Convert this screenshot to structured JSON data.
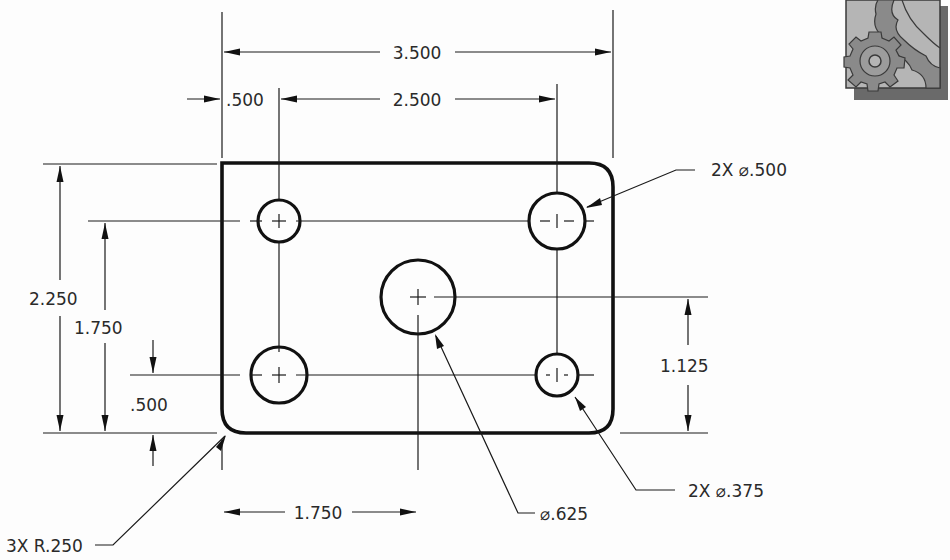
{
  "drawing": {
    "units_note": "",
    "overall_width_dim": "3.500",
    "left_hole_offset_dim": ".500",
    "hole_spacing_x_dim": "2.500",
    "overall_height_dim": "2.250",
    "hole_spacing_y_dim": "1.750",
    "bottom_hole_offset_dim": ".500",
    "center_hole_x_dim": "1.750",
    "center_hole_y_dim": "1.125",
    "large_hole_callout": "2X ⌀.500",
    "small_hole_callout": "2X ⌀.375",
    "center_hole_callout": "⌀.625",
    "corner_radius_callout": "3X R.250"
  },
  "icon": {
    "name": "gear-logo-icon",
    "colors": {
      "bg": "#b5b5b5",
      "gear_dark": "#8a8a8a",
      "outline": "#3a3a3a",
      "shadow": "#6a6a6a"
    }
  }
}
